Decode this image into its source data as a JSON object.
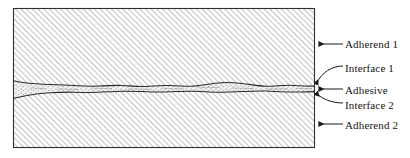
{
  "figure": {
    "type": "cross-section-diagram",
    "background_color": "#ffffff",
    "line_color": "#1a1a1a",
    "box": {
      "x": 13,
      "y": 8,
      "width": 302,
      "height": 140,
      "border_color": "#333333",
      "border_width": 1
    },
    "regions": [
      {
        "id": "adherend-1",
        "name": "Adherend 1",
        "fill": "hatch-45-up",
        "hatch_color": "#9a9a9a",
        "hatch_spacing_px": 4,
        "description": "Upper adherend block, diagonal hatching rising to the right"
      },
      {
        "id": "adhesive",
        "name": "Adhesive",
        "fill": "stipple",
        "stipple_color": "#777777",
        "description": "Thin irregular wavy adhesive layer between the two adherends"
      },
      {
        "id": "adherend-2",
        "name": "Adherend 2",
        "fill": "hatch-45-up",
        "hatch_color": "#9a9a9a",
        "hatch_spacing_px": 4,
        "description": "Lower adherend block, diagonal hatching rising to the right"
      }
    ],
    "interfaces": [
      {
        "id": "interface-1",
        "name": "Interface 1",
        "description": "Boundary between Adherend 1 and Adhesive"
      },
      {
        "id": "interface-2",
        "name": "Interface 2",
        "description": "Boundary between Adhesive and Adherend 2"
      }
    ]
  },
  "labels": {
    "adherend_1": "Adherend 1",
    "interface_1": "Interface 1",
    "adhesive": "Adhesive",
    "interface_2": "Interface 2",
    "adherend_2": "Adherend 2"
  },
  "leaders": [
    {
      "target": "adherend_1",
      "style": "arrow-horizontal",
      "from_x": 340,
      "from_y": 44,
      "to_x": 318,
      "to_y": 44
    },
    {
      "target": "interface_1",
      "style": "diagonal-curve",
      "from_x": 340,
      "from_y": 66,
      "to_x": 315,
      "to_y": 84
    },
    {
      "target": "adhesive",
      "style": "arrow-horizontal",
      "from_x": 340,
      "from_y": 89,
      "to_x": 318,
      "to_y": 89
    },
    {
      "target": "interface_2",
      "style": "diagonal-curve",
      "from_x": 340,
      "from_y": 103,
      "to_x": 315,
      "to_y": 93
    },
    {
      "target": "adherend_2",
      "style": "arrow-horizontal",
      "from_x": 340,
      "from_y": 124,
      "to_x": 318,
      "to_y": 124
    }
  ]
}
